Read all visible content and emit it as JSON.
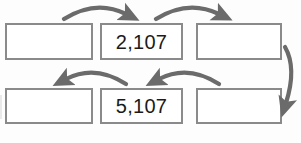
{
  "diagram": {
    "background_color": "#fdfdfd",
    "box_border_color": "#8a8a8a",
    "box_fill_color": "#ffffff",
    "arrow_color": "#6b6b6b",
    "text_color": "#1b1b1b",
    "rows": [
      {
        "row_label": "top-row",
        "cells": [
          {
            "name": "cell-r1c1",
            "value": "",
            "filled": false
          },
          {
            "name": "cell-r1c2",
            "value": "2,107",
            "filled": true
          },
          {
            "name": "cell-r1c3",
            "value": "",
            "filled": false
          }
        ]
      },
      {
        "row_label": "bottom-row",
        "cells": [
          {
            "name": "cell-r2c1",
            "value": "",
            "filled": false
          },
          {
            "name": "cell-r2c2",
            "value": "5,107",
            "filled": true
          },
          {
            "name": "cell-r2c3",
            "value": "",
            "filled": false
          }
        ]
      }
    ],
    "arrows": [
      {
        "name": "arrow-top-left-to-middle",
        "direction": "right",
        "from": "cell-r1c1",
        "to": "cell-r1c2"
      },
      {
        "name": "arrow-top-middle-to-right",
        "direction": "right",
        "from": "cell-r1c2",
        "to": "cell-r1c3"
      },
      {
        "name": "arrow-right-wrap-down",
        "direction": "down",
        "from": "cell-r1c3",
        "to": "cell-r2c3"
      },
      {
        "name": "arrow-bottom-right-to-middle",
        "direction": "left",
        "from": "cell-r2c3",
        "to": "cell-r2c2"
      },
      {
        "name": "arrow-bottom-middle-to-left",
        "direction": "left",
        "from": "cell-r2c2",
        "to": "cell-r2c1"
      }
    ]
  }
}
